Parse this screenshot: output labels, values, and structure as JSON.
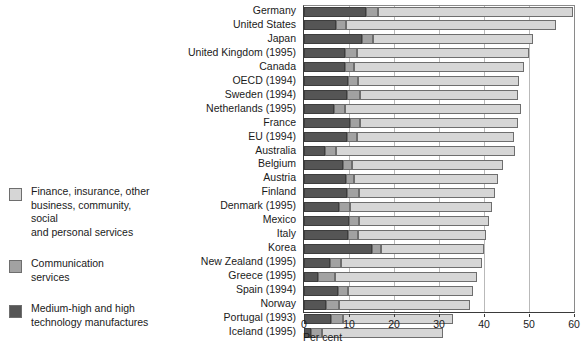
{
  "chart_data": {
    "type": "bar",
    "orientation": "horizontal",
    "stacked": true,
    "title": "",
    "xlabel": "Per cent",
    "ylabel": "",
    "xlim": [
      0,
      60
    ],
    "xticks": [
      0,
      10,
      20,
      30,
      40,
      50,
      60
    ],
    "grid": true,
    "grid_axis": "x",
    "legend_position": "left",
    "categories": [
      "Germany",
      "United States",
      "Japan",
      "United Kingdom (1995)",
      "Canada",
      "OECD (1994)",
      "Sweden (1994)",
      "Netherlands (1995)",
      "France",
      "EU (1994)",
      "Australia",
      "Belgium",
      "Austria",
      "Finland",
      "Denmark (1995)",
      "Mexico",
      "Italy",
      "Korea",
      "New Zealand (1995)",
      "Greece (1995)",
      "Spain (1994)",
      "Norway",
      "Portugal (1993)",
      "Iceland (1995)"
    ],
    "series": [
      {
        "name": "Medium-high and high technology manufactures",
        "color": "#555555",
        "values": [
          13.7,
          7.0,
          12.8,
          9.2,
          9.0,
          9.7,
          9.6,
          6.6,
          10.2,
          9.5,
          4.7,
          8.6,
          9.3,
          9.6,
          7.8,
          10.1,
          9.8,
          15.2,
          5.7,
          3.1,
          7.6,
          4.9,
          5.9,
          1.5
        ]
      },
      {
        "name": "Communication services",
        "color": "#a2a2a2",
        "values": [
          2.7,
          2.3,
          2.6,
          2.5,
          2.2,
          2.2,
          2.8,
          2.5,
          2.2,
          2.2,
          2.5,
          2.0,
          1.9,
          2.7,
          2.5,
          2.2,
          2.1,
          1.9,
          2.6,
          3.8,
          2.2,
          2.8,
          2.7,
          2.6
        ]
      },
      {
        "name": "Finance, insurance, other business, community, social and personal services",
        "color": "#d6d6d6",
        "values": [
          43.4,
          46.7,
          35.6,
          38.3,
          37.6,
          35.9,
          35.2,
          39.1,
          35.2,
          34.9,
          39.6,
          33.6,
          31.9,
          30.1,
          31.4,
          28.9,
          28.6,
          22.9,
          31.3,
          31.6,
          27.7,
          29.3,
          24.6,
          26.7
        ]
      }
    ],
    "totals": [
      59.8,
      56.0,
      51.0,
      50.0,
      48.8,
      47.8,
      47.6,
      48.2,
      47.6,
      46.6,
      46.8,
      44.2,
      43.1,
      42.4,
      41.7,
      41.2,
      40.5,
      40.0,
      39.6,
      38.5,
      37.5,
      37.0,
      33.2,
      30.8
    ]
  },
  "legend": {
    "entries": [
      {
        "label": "Finance, insurance, other\nbusiness, community, social\nand personal services",
        "color": "#d6d6d6",
        "swatch_name": "legend-swatch-services"
      },
      {
        "label": "Communication\nservices",
        "color": "#a2a2a2",
        "swatch_name": "legend-swatch-communication"
      },
      {
        "label": "Medium-high and high\ntechnology manufactures",
        "color": "#555555",
        "swatch_name": "legend-swatch-technology"
      }
    ]
  },
  "axis": {
    "title": "Per cent"
  }
}
